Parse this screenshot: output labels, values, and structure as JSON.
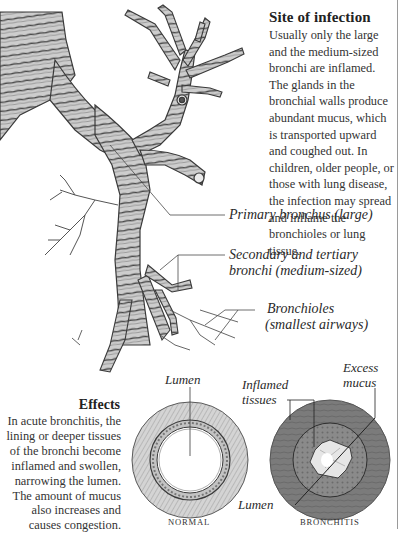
{
  "site_of_infection": {
    "title": "Site of infection",
    "body": "Usually only the large and the medium-sized bronchi are inflamed. The glands in the bronchial walls produce abundant mucus, which is transported upward and coughed out. In children, older people, or those with lung disease, the infection may spread and inflame the bronchioles or lung tissue."
  },
  "bronchial_tree_labels": {
    "primary": "Primary bronchus (large)",
    "secondary_line1": "Secondary and tertiary",
    "secondary_line2": "bronchi (medium-sized)",
    "bronchioles_line1": "Bronchioles",
    "bronchioles_line2": "(smallest airways)"
  },
  "effects": {
    "title": "Effects",
    "body": "In acute bronchitis, the lining or deeper tissues of the bronchi become inflamed and swollen, narrowing the lumen. The amount of mucus also increases and causes congestion."
  },
  "cross_sections": {
    "normal": {
      "caption": "NORMAL",
      "lumen_label": "Lumen"
    },
    "bronchitis": {
      "caption": "BRONCHITIS",
      "inflamed_line1": "Inflamed",
      "inflamed_line2": "tissues",
      "mucus_line1": "Excess",
      "mucus_line2": "mucus",
      "lumen_label": "Lumen"
    }
  },
  "colors": {
    "airway_fill": "#c9c9c9",
    "airway_stroke": "#3a3a3a",
    "normal_wall": "#cfcfcf",
    "bronchitis_wall": "#7d7d7d",
    "bronchitis_inner": "#8a8a8a",
    "mucus": "#e8e8e8"
  }
}
